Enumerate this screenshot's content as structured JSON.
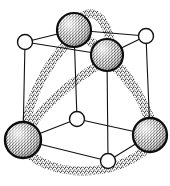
{
  "figure": {
    "width": 170,
    "height": 186,
    "background_color": "#ffffff",
    "caption": ""
  },
  "style": {
    "wireframe_color": "#111111",
    "wireframe_width": 1.1,
    "bond_color": "#8a8a8a",
    "bond_stipple_color": "#3a3a3a",
    "bond_width": 9,
    "sphere_outline_color": "#0d0d0d",
    "sphere_fill_color": "#e9e9e9",
    "sphere_stipple_color": "#2e2e2e",
    "small_node_fill": "#ffffff",
    "small_node_outline": "#111111"
  },
  "legend": {
    "large_sphere_label": "large stippled atom",
    "small_circle_label": "small open atom",
    "thick_band_label": "stippled bond band",
    "thin_line_label": "unit cell edge"
  },
  "chart_data": {
    "type": "diagram",
    "nodes": [
      {
        "id": "n1",
        "label": "A1",
        "kind": "large-sphere",
        "x": 74,
        "y": 30,
        "r": 17
      },
      {
        "id": "n2",
        "label": "A2",
        "kind": "large-sphere",
        "x": 107,
        "y": 55,
        "r": 16
      },
      {
        "id": "n3",
        "label": "A3",
        "kind": "large-sphere",
        "x": 23,
        "y": 140,
        "r": 18
      },
      {
        "id": "n4",
        "label": "A4",
        "kind": "large-sphere",
        "x": 150,
        "y": 135,
        "r": 17
      },
      {
        "id": "n5",
        "label": "B1",
        "kind": "small-circle",
        "x": 25,
        "y": 42,
        "r": 7.5
      },
      {
        "id": "n6",
        "label": "B2",
        "kind": "small-circle",
        "x": 146,
        "y": 36,
        "r": 7.5
      },
      {
        "id": "n7",
        "label": "B3",
        "kind": "small-circle",
        "x": 77,
        "y": 119,
        "r": 7.5
      },
      {
        "id": "n8",
        "label": "B4",
        "kind": "small-circle",
        "x": 108,
        "y": 161,
        "r": 7.5
      }
    ],
    "cell_edges": [
      {
        "from": "n5",
        "to": "n1"
      },
      {
        "from": "n1",
        "to": "n6"
      },
      {
        "from": "n5",
        "to": "n2"
      },
      {
        "from": "n2",
        "to": "n6"
      },
      {
        "from": "n5",
        "to": "n3"
      },
      {
        "from": "n1",
        "to": "n7"
      },
      {
        "from": "n6",
        "to": "n4"
      },
      {
        "from": "n2",
        "to": "n8"
      },
      {
        "from": "n3",
        "to": "n7"
      },
      {
        "from": "n7",
        "to": "n4"
      },
      {
        "from": "n3",
        "to": "n8"
      },
      {
        "from": "n8",
        "to": "n4"
      }
    ],
    "bonds": [
      {
        "from": "n1",
        "to": "n2",
        "arc": "over-top"
      },
      {
        "from": "n1",
        "to": "n3",
        "arc": "left-front"
      },
      {
        "from": "n2",
        "to": "n3",
        "arc": "left-inner"
      },
      {
        "from": "n1",
        "to": "n4",
        "arc": "right-inner"
      },
      {
        "from": "n2",
        "to": "n4",
        "arc": "right-front"
      },
      {
        "from": "n3",
        "to": "n4",
        "arc": "under-bottom"
      }
    ],
    "counts": {
      "large_spheres": 4,
      "small_circles": 8,
      "bonds": 6,
      "cell_edges": 12
    }
  }
}
